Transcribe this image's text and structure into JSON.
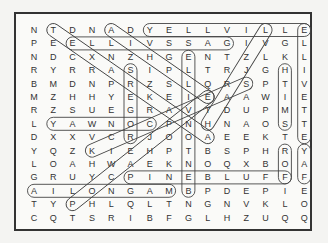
{
  "puzzle": {
    "grid": [
      "NTDNADYELLVILLE",
      "PEELLIVSSAGIVGL",
      "NDCXNZHGENTZLKL",
      "RYRRASIPLTRJGHI",
      "BMDNPRZSLQRSPTV",
      "MZHHYEKEIEAAWIE",
      "RZSUEGRAVTDUPMT",
      "LYAWNOCPNHNAOST",
      "DXXVCRJOOAEEKTE",
      "YQZKIEHPTBSPHRY",
      "LOAHWAEKNOQXBOA",
      "GRUYCPINEBLUFFF",
      "AILONGAMBPDEPIE",
      "TYPHLQLTNGNVKLO",
      "CQTSRIBFGLHZUQQ"
    ],
    "found_words": [
      {
        "word": "YELLVILLE",
        "from": [
          0,
          6
        ],
        "to": [
          0,
          14
        ]
      },
      {
        "word": "ELLIVSSAG",
        "from": [
          1,
          2
        ],
        "to": [
          1,
          10
        ]
      },
      {
        "word": "YAWNOC",
        "from": [
          7,
          1
        ],
        "to": [
          7,
          6
        ]
      },
      {
        "word": "PINEBLUFF",
        "from": [
          11,
          5
        ],
        "to": [
          11,
          13
        ]
      },
      {
        "word": "AILONGAM",
        "from": [
          12,
          0
        ],
        "to": [
          12,
          7
        ]
      },
      {
        "word": "SREGOR",
        "from": [
          3,
          5
        ],
        "to": [
          8,
          5
        ]
      },
      {
        "word": "ELLIVETTE",
        "from": [
          0,
          14
        ],
        "to": [
          8,
          14
        ]
      },
      {
        "word": "HTIMS",
        "from": [
          3,
          13
        ],
        "to": [
          7,
          13
        ]
      },
      {
        "word": "ROF",
        "from": [
          9,
          13
        ],
        "to": [
          11,
          13
        ]
      },
      {
        "word": "YAF",
        "from": [
          9,
          14
        ],
        "to": [
          11,
          14
        ]
      },
      {
        "word": "ELLINOTNEB",
        "from": [
          2,
          8
        ],
        "to": [
          12,
          8
        ]
      },
      {
        "word": "TEXARKANA",
        "from": [
          0,
          1
        ],
        "to": [
          8,
          9
        ]
      },
      {
        "word": "ADHERE",
        "from": [
          0,
          4
        ],
        "to": [
          5,
          9
        ]
      },
      {
        "word": "LEACH",
        "from": [
          0,
          12
        ],
        "to": [
          7,
          9
        ]
      },
      {
        "word": "KEOSAUQUA",
        "from": [
          9,
          3
        ],
        "to": [
          4,
          11
        ]
      },
      {
        "word": "PHLEGM",
        "from": [
          13,
          2
        ],
        "to": [
          5,
          9
        ]
      }
    ]
  }
}
